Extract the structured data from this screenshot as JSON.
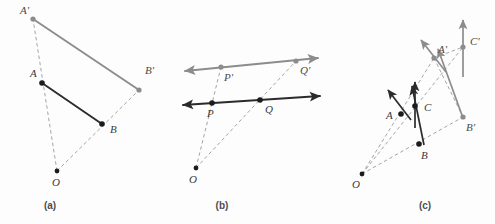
{
  "figure": {
    "width": 495,
    "height": 224,
    "background_color": "#fdfdfd",
    "colors": {
      "original": "#1c1c1c",
      "image": "#8c8c8c",
      "dashed_ray": "#9a9a9a",
      "label": "#3a3a3a",
      "caption": "#4d4d4d"
    }
  },
  "panels": [
    {
      "id": "a",
      "caption": "(a)",
      "caption_pos": {
        "x": 50,
        "y": 209
      },
      "description": "Segment AB and its dilated image A'B' from center O",
      "center": {
        "name": "O",
        "x": 57,
        "y": 171,
        "label_x": 52,
        "label_y": 186,
        "kind": "center"
      },
      "points": [
        {
          "name": "A",
          "x": 42,
          "y": 83,
          "label_x": 30,
          "label_y": 77,
          "kind": "original"
        },
        {
          "name": "B",
          "x": 102,
          "y": 124,
          "label_x": 110,
          "label_y": 133,
          "kind": "original"
        },
        {
          "name": "A'",
          "x": 33,
          "y": 19,
          "label_x": 20,
          "label_y": 14,
          "kind": "image"
        },
        {
          "name": "B'",
          "x": 139,
          "y": 90,
          "label_x": 145,
          "label_y": 74,
          "kind": "image"
        }
      ],
      "segments": [
        {
          "from": "A",
          "to": "B",
          "kind": "original"
        },
        {
          "from": "A'",
          "to": "B'",
          "kind": "image"
        }
      ],
      "rays": [
        {
          "from": "O",
          "to": "A'",
          "through": "A"
        },
        {
          "from": "O",
          "to": "B'",
          "through": "B"
        }
      ]
    },
    {
      "id": "b",
      "caption": "(b)",
      "caption_pos": {
        "x": 222,
        "y": 209
      },
      "description": "Line PQ and its parallel dilated image line P'Q' from center O",
      "center": {
        "name": "O",
        "x": 196,
        "y": 168,
        "label_x": 189,
        "label_y": 183,
        "kind": "center"
      },
      "points": [
        {
          "name": "P",
          "x": 212,
          "y": 103,
          "label_x": 207,
          "label_y": 117,
          "kind": "original"
        },
        {
          "name": "Q",
          "x": 260,
          "y": 100,
          "label_x": 265,
          "label_y": 113,
          "kind": "original"
        },
        {
          "name": "P'",
          "x": 221,
          "y": 67,
          "label_x": 224,
          "label_y": 81,
          "kind": "image"
        },
        {
          "name": "Q'",
          "x": 296,
          "y": 61,
          "label_x": 300,
          "label_y": 74,
          "kind": "image"
        }
      ],
      "lines": [
        {
          "name": "line-PQ",
          "kind": "original",
          "x1": 183,
          "y1": 105,
          "x2": 320,
          "y2": 96,
          "arrows": "both"
        },
        {
          "name": "line-PpQp",
          "kind": "image",
          "x1": 185,
          "y1": 71,
          "x2": 318,
          "y2": 58,
          "arrows": "both"
        }
      ],
      "rays": [
        {
          "from": "O",
          "to": "P'",
          "through": "P"
        },
        {
          "from": "O",
          "to": "Q'",
          "through": "Q"
        }
      ]
    },
    {
      "id": "c",
      "caption": "(c)",
      "caption_pos": {
        "x": 425,
        "y": 209
      },
      "description": "Vectors at A, B, C and their dilated images at A', B', C' from center O",
      "center": {
        "name": "O",
        "x": 362,
        "y": 174,
        "label_x": 352,
        "label_y": 188,
        "kind": "center"
      },
      "points": [
        {
          "name": "A",
          "x": 401,
          "y": 114,
          "label_x": 386,
          "label_y": 119,
          "kind": "original"
        },
        {
          "name": "B",
          "x": 419,
          "y": 144,
          "label_x": 421,
          "label_y": 159,
          "kind": "original"
        },
        {
          "name": "C",
          "x": 415,
          "y": 106,
          "label_x": 424,
          "label_y": 111,
          "kind": "original"
        },
        {
          "name": "A'",
          "x": 434,
          "y": 58,
          "label_x": 438,
          "label_y": 53,
          "kind": "image"
        },
        {
          "name": "B'",
          "x": 463,
          "y": 117,
          "label_x": 466,
          "label_y": 131,
          "kind": "image"
        },
        {
          "name": "C'",
          "x": 463,
          "y": 47,
          "label_x": 470,
          "label_y": 45,
          "kind": "image"
        }
      ],
      "vectors": [
        {
          "name": "vector-at-A",
          "kind": "original",
          "x1": 411,
          "y1": 120,
          "x2": 388,
          "y2": 90
        },
        {
          "name": "vector-at-C",
          "kind": "original",
          "x1": 415,
          "y1": 128,
          "x2": 415,
          "y2": 82
        },
        {
          "name": "vector-at-B",
          "kind": "original",
          "x1": 424,
          "y1": 145,
          "x2": 412,
          "y2": 86
        },
        {
          "name": "vector-at-Ap",
          "kind": "image",
          "x1": 446,
          "y1": 72,
          "x2": 421,
          "y2": 40
        },
        {
          "name": "vector-at-Cp",
          "kind": "image",
          "x1": 463,
          "y1": 77,
          "x2": 463,
          "y2": 20
        },
        {
          "name": "vector-at-Bp",
          "kind": "image",
          "x1": 463,
          "y1": 118,
          "x2": 438,
          "y2": 49
        }
      ],
      "rays": [
        {
          "from": "O",
          "to": "A'",
          "through": "A"
        },
        {
          "from": "O",
          "to": "C'",
          "through": "C"
        },
        {
          "from": "O",
          "to": "B'",
          "through": "B"
        }
      ],
      "image_segments": [
        {
          "from": "A'",
          "to": "C'",
          "kind": "image-dashed"
        },
        {
          "from": "A'",
          "to": "B'",
          "kind": "image-dashed"
        }
      ]
    }
  ]
}
